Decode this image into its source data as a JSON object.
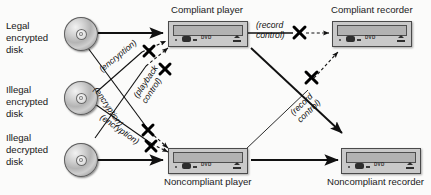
{
  "diagram": {
    "type": "flow-diagram",
    "sources": [
      {
        "id": "legal-encrypted-disk",
        "label": "Legal\nencrypted\ndisk",
        "icon": "optical-disc-icon"
      },
      {
        "id": "illegal-encrypted-disk",
        "label": "Illegal\nencrypted\ndisk",
        "icon": "optical-disc-icon"
      },
      {
        "id": "illegal-decrypted-disk",
        "label": "Illegal\ndecrypted\ndisk",
        "icon": "optical-disc-icon"
      }
    ],
    "devices": [
      {
        "id": "compliant-player",
        "label": "Compliant player",
        "icon": "dvd-drive-icon",
        "face_text": "DVD",
        "label_position": "above"
      },
      {
        "id": "compliant-recorder",
        "label": "Compliant recorder",
        "icon": "dvd-drive-icon",
        "face_text": "DVD",
        "label_position": "above"
      },
      {
        "id": "noncompliant-player",
        "label": "Noncompliant player",
        "icon": "dvd-drive-icon",
        "face_text": "DVD",
        "label_position": "below"
      },
      {
        "id": "noncompliant-recorder",
        "label": "Noncompliant recorder",
        "icon": "dvd-drive-icon",
        "face_text": "DVD",
        "label_position": "below"
      }
    ],
    "edges": [
      {
        "id": "legal-to-compliant-player",
        "from": "legal-encrypted-disk",
        "to": "compliant-player",
        "label": "",
        "blocked": false,
        "style": "solid"
      },
      {
        "id": "legal-to-noncompliant-player",
        "from": "legal-encrypted-disk",
        "to": "noncompliant-player",
        "label": "(encryption)",
        "blocked": true,
        "style": "dashed",
        "block_marker": "x-mark"
      },
      {
        "id": "illegal-enc-to-compliant-player",
        "from": "illegal-encrypted-disk",
        "to": "compliant-player",
        "label": "(encryption)",
        "blocked": true,
        "style": "dashed",
        "block_marker": "x-mark"
      },
      {
        "id": "illegal-enc-to-noncompliant",
        "from": "illegal-encrypted-disk",
        "to": "noncompliant-player",
        "label": "(encryption)",
        "blocked": true,
        "style": "dashed",
        "block_marker": "x-mark"
      },
      {
        "id": "illegal-dec-to-compliant-player",
        "from": "illegal-decrypted-disk",
        "to": "compliant-player",
        "label": "(playback\ncontrol)",
        "blocked": true,
        "style": "dashed",
        "block_marker": "x-mark"
      },
      {
        "id": "illegal-dec-to-noncompliant",
        "from": "illegal-decrypted-disk",
        "to": "noncompliant-player",
        "label": "",
        "blocked": false,
        "style": "solid"
      },
      {
        "id": "compliant-player-to-recorder",
        "from": "compliant-player",
        "to": "compliant-recorder",
        "label": "(record\ncontrol)",
        "blocked": true,
        "style": "dashed",
        "block_marker": "x-mark"
      },
      {
        "id": "noncompliant-player-to-compliant-recorder",
        "from": "noncompliant-player",
        "to": "compliant-recorder",
        "label": "(record\ncontrol)",
        "blocked": true,
        "style": "dashed",
        "block_marker": "x-mark"
      },
      {
        "id": "compliant-player-to-noncompliant-recorder",
        "from": "compliant-player",
        "to": "noncompliant-recorder",
        "label": "",
        "blocked": false,
        "style": "solid"
      },
      {
        "id": "noncompliant-player-to-noncompliant-recorder",
        "from": "noncompliant-player",
        "to": "noncompliant-recorder",
        "label": "",
        "blocked": false,
        "style": "solid"
      }
    ],
    "edge_label_texts": {
      "encryption": "(encryption)",
      "playback_line1": "(playback",
      "playback_line2": "control)",
      "record_line1": "(record",
      "record_line2": "control)"
    },
    "colors": {
      "line": "#111111",
      "device_body": "#c9c9c9",
      "device_border": "#4a4a4a",
      "background": "#fbfbfa",
      "text": "#161616"
    }
  }
}
